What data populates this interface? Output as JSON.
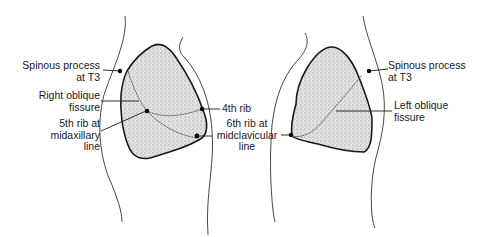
{
  "diagram": {
    "views": [
      {
        "side": "right",
        "labels": {
          "spinous_process": "Spinous process\nat T3",
          "oblique_fissure": "Right oblique\nfissure",
          "fifth_rib": "5th rib at\nmidaxillary\nline",
          "fourth_rib": "4th rib",
          "sixth_rib": "6th rib at\nmidclavicular\nline"
        }
      },
      {
        "side": "left",
        "labels": {
          "spinous_process": "Spinous process\nat T3",
          "oblique_fissure": "Left oblique\nfissure"
        }
      }
    ],
    "colors": {
      "lung_fill": "#c8c8c8",
      "outline": "#1a1a1a",
      "background": "#ffffff"
    }
  }
}
